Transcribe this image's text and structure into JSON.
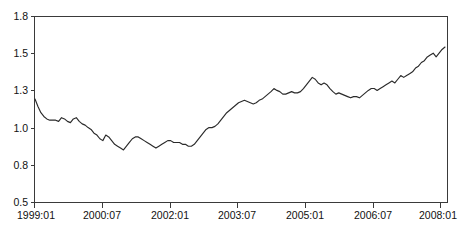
{
  "chart_data": {
    "type": "line",
    "title": "",
    "subtitle": "",
    "xlabel": "",
    "ylabel": "",
    "grid": false,
    "legend": false,
    "legend_position": "none",
    "x_tick_labels": [
      "1999:01",
      "2000:07",
      "2002:01",
      "2003:07",
      "2005:01",
      "2006:07",
      "2008:01"
    ],
    "y_tick_labels": [
      "1.8",
      "1.5",
      "1.3",
      "1.0",
      "0.8",
      "0.5"
    ],
    "y_tick_values": [
      1.8,
      1.5,
      1.3,
      1.0,
      0.8,
      0.5
    ],
    "ylim": [
      0.5,
      1.8
    ],
    "x_start_label": "1999:01",
    "x_end_label": "2008:03",
    "x_tick_interval_months": 18,
    "series": [
      {
        "name": "",
        "x": [
          "1999:01",
          "1999:02",
          "1999:03",
          "1999:04",
          "1999:05",
          "1999:06",
          "1999:07",
          "1999:08",
          "1999:09",
          "1999:10",
          "1999:11",
          "1999:12",
          "2000:01",
          "2000:02",
          "2000:03",
          "2000:04",
          "2000:05",
          "2000:06",
          "2000:07",
          "2000:08",
          "2000:09",
          "2000:10",
          "2000:11",
          "2000:12",
          "2001:01",
          "2001:02",
          "2001:03",
          "2001:04",
          "2001:05",
          "2001:06",
          "2001:07",
          "2001:08",
          "2001:09",
          "2001:10",
          "2001:11",
          "2001:12",
          "2002:01",
          "2002:02",
          "2002:03",
          "2002:04",
          "2002:05",
          "2002:06",
          "2002:07",
          "2002:08",
          "2002:09",
          "2002:10",
          "2002:11",
          "2002:12",
          "2003:01",
          "2003:02",
          "2003:03",
          "2003:04",
          "2003:05",
          "2003:06",
          "2003:07",
          "2003:08",
          "2003:09",
          "2003:10",
          "2003:11",
          "2003:12",
          "2004:01",
          "2004:02",
          "2004:03",
          "2004:04",
          "2004:05",
          "2004:06",
          "2004:07",
          "2004:08",
          "2004:09",
          "2004:10",
          "2004:11",
          "2004:12",
          "2005:01",
          "2005:02",
          "2005:03",
          "2005:04",
          "2005:05",
          "2005:06",
          "2005:07",
          "2005:08",
          "2005:09",
          "2005:10",
          "2005:11",
          "2005:12",
          "2006:01",
          "2006:02",
          "2006:03",
          "2006:04",
          "2006:05",
          "2006:06",
          "2006:07",
          "2006:08",
          "2006:09",
          "2006:10",
          "2006:11",
          "2006:12",
          "2007:01",
          "2007:02",
          "2007:03",
          "2007:04",
          "2007:05",
          "2007:06",
          "2007:07",
          "2007:08",
          "2007:09",
          "2007:10",
          "2007:11",
          "2007:12",
          "2008:01",
          "2008:02",
          "2008:03"
        ],
        "values": [
          1.23,
          1.17,
          1.12,
          1.09,
          1.07,
          1.06,
          1.06,
          1.06,
          1.05,
          1.08,
          1.07,
          1.05,
          1.04,
          1.07,
          1.08,
          1.05,
          1.03,
          1.02,
          1.0,
          0.99,
          0.97,
          0.96,
          0.94,
          0.93,
          0.96,
          0.95,
          0.93,
          0.91,
          0.9,
          0.89,
          0.88,
          0.9,
          0.92,
          0.94,
          0.95,
          0.95,
          0.94,
          0.93,
          0.92,
          0.91,
          0.9,
          0.89,
          0.9,
          0.91,
          0.92,
          0.93,
          0.93,
          0.92,
          0.92,
          0.92,
          0.91,
          0.91,
          0.9,
          0.9,
          0.91,
          0.93,
          0.95,
          0.97,
          0.99,
          1.0,
          1.0,
          1.01,
          1.03,
          1.06,
          1.09,
          1.12,
          1.14,
          1.16,
          1.18,
          1.2,
          1.21,
          1.22,
          1.21,
          1.2,
          1.19,
          1.2,
          1.22,
          1.23,
          1.25,
          1.27,
          1.29,
          1.31,
          1.3,
          1.29,
          1.27,
          1.27,
          1.28,
          1.29,
          1.28,
          1.28,
          1.29,
          1.31,
          1.33,
          1.35,
          1.37,
          1.36,
          1.34,
          1.33,
          1.34,
          1.33,
          1.31,
          1.29,
          1.27,
          1.28,
          1.27,
          1.26,
          1.25,
          1.24,
          1.25,
          1.25,
          1.24
        ]
      }
    ],
    "extended_values_note": "",
    "series_tail": [
      1.26,
      1.28,
      1.3,
      1.31,
      1.31,
      1.3,
      1.31,
      1.32,
      1.33,
      1.34,
      1.35,
      1.34,
      1.36,
      1.38,
      1.37,
      1.38,
      1.39,
      1.4,
      1.42,
      1.43,
      1.45,
      1.46,
      1.48,
      1.49,
      1.5,
      1.48,
      1.5,
      1.53,
      1.55
    ]
  },
  "axes": {
    "y_axis_name": "y-axis",
    "x_axis_name": "x-axis"
  }
}
